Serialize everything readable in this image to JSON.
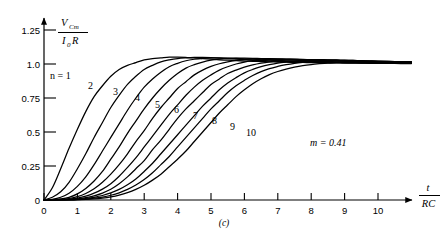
{
  "figure": {
    "label": "(c)",
    "annotation": "m = 0.41",
    "annotation_symbol": "m",
    "annotation_value": "0.41",
    "series_prefix": "n",
    "series_prefix_text": "n = 1"
  },
  "axes": {
    "y": {
      "label_numerator": "V",
      "label_numerator_sub": "Cm",
      "label_denominator": "I",
      "label_denominator_sub": "0",
      "label_denominator_tail": "R",
      "ticks": [
        "0",
        "0.25",
        "0.5",
        "0.75",
        "1.0",
        "1.25"
      ],
      "tick_values": [
        0,
        0.25,
        0.5,
        0.75,
        1.0,
        1.25
      ]
    },
    "x": {
      "label_numerator": "t",
      "label_denominator": "RC",
      "ticks": [
        "0",
        "1",
        "2",
        "3",
        "4",
        "5",
        "6",
        "7",
        "8",
        "9",
        "10"
      ],
      "tick_values": [
        0,
        1,
        2,
        3,
        4,
        5,
        6,
        7,
        8,
        9,
        10
      ]
    }
  },
  "curve_labels": [
    "1",
    "2",
    "3",
    "4",
    "5",
    "6",
    "7",
    "8",
    "9",
    "10"
  ],
  "chart_data": {
    "type": "line",
    "title": "",
    "xlabel": "t/RC",
    "ylabel": "V_Cm / (I_0 R)",
    "xlim": [
      0,
      11.2
    ],
    "ylim": [
      0,
      1.3
    ],
    "grid": false,
    "legend": "inline-curve-labels",
    "annotations": [
      "m = 0.41",
      "n = 1",
      "(c)"
    ],
    "xticks": [
      0,
      1,
      2,
      3,
      4,
      5,
      6,
      7,
      8,
      9,
      10
    ],
    "yticks": [
      0,
      0.25,
      0.5,
      0.75,
      1.0,
      1.25
    ],
    "x": [
      0,
      0.25,
      0.5,
      0.75,
      1,
      1.25,
      1.5,
      1.75,
      2,
      2.25,
      2.5,
      2.75,
      3,
      3.25,
      3.5,
      3.75,
      4,
      4.25,
      4.5,
      4.75,
      5,
      5.25,
      5.5,
      5.75,
      6,
      6.25,
      6.5,
      6.75,
      7,
      7.25,
      7.5,
      7.75,
      8,
      8.25,
      8.5,
      8.75,
      9,
      9.25,
      9.5,
      9.75,
      10,
      10.5,
      11
    ],
    "series": [
      {
        "name": "n = 1",
        "label": "1",
        "values": [
          0,
          0.09,
          0.23,
          0.38,
          0.52,
          0.65,
          0.76,
          0.84,
          0.91,
          0.96,
          0.99,
          1.01,
          1.03,
          1.04,
          1.045,
          1.05,
          1.05,
          1.048,
          1.045,
          1.04,
          1.035,
          1.03,
          1.028,
          1.025,
          1.022,
          1.02,
          1.018,
          1.016,
          1.014,
          1.013,
          1.012,
          1.011,
          1.01,
          1.009,
          1.008,
          1.008,
          1.007,
          1.006,
          1.006,
          1.005,
          1.005,
          1.004,
          1.003
        ]
      },
      {
        "name": "n = 2",
        "label": "2",
        "values": [
          0,
          0.02,
          0.06,
          0.13,
          0.23,
          0.34,
          0.46,
          0.57,
          0.68,
          0.77,
          0.85,
          0.91,
          0.96,
          0.99,
          1.015,
          1.03,
          1.04,
          1.045,
          1.048,
          1.048,
          1.046,
          1.043,
          1.04,
          1.036,
          1.032,
          1.029,
          1.026,
          1.023,
          1.02,
          1.018,
          1.016,
          1.014,
          1.013,
          1.012,
          1.011,
          1.01,
          1.009,
          1.008,
          1.007,
          1.007,
          1.006,
          1.005,
          1.004
        ]
      },
      {
        "name": "n = 3",
        "label": "3",
        "values": [
          0,
          0.005,
          0.02,
          0.05,
          0.1,
          0.17,
          0.26,
          0.36,
          0.46,
          0.56,
          0.66,
          0.75,
          0.83,
          0.89,
          0.94,
          0.98,
          1.005,
          1.024,
          1.035,
          1.042,
          1.045,
          1.045,
          1.044,
          1.041,
          1.038,
          1.035,
          1.031,
          1.028,
          1.025,
          1.022,
          1.02,
          1.018,
          1.016,
          1.014,
          1.013,
          1.012,
          1.011,
          1.01,
          1.009,
          1.008,
          1.007,
          1.006,
          1.005
        ]
      },
      {
        "name": "n = 4",
        "label": "4",
        "values": [
          0,
          0.002,
          0.008,
          0.02,
          0.045,
          0.085,
          0.14,
          0.21,
          0.3,
          0.39,
          0.49,
          0.58,
          0.67,
          0.75,
          0.82,
          0.88,
          0.93,
          0.97,
          0.995,
          1.014,
          1.028,
          1.036,
          1.041,
          1.043,
          1.043,
          1.042,
          1.04,
          1.037,
          1.034,
          1.031,
          1.028,
          1.025,
          1.022,
          1.02,
          1.018,
          1.016,
          1.014,
          1.013,
          1.012,
          1.011,
          1.01,
          1.008,
          1.007
        ]
      },
      {
        "name": "n = 5",
        "label": "5",
        "values": [
          0,
          0.001,
          0.004,
          0.011,
          0.025,
          0.048,
          0.082,
          0.13,
          0.19,
          0.26,
          0.34,
          0.43,
          0.51,
          0.6,
          0.68,
          0.75,
          0.82,
          0.87,
          0.92,
          0.955,
          0.982,
          1.002,
          1.016,
          1.026,
          1.033,
          1.037,
          1.039,
          1.039,
          1.038,
          1.036,
          1.034,
          1.032,
          1.029,
          1.027,
          1.024,
          1.022,
          1.02,
          1.018,
          1.016,
          1.014,
          1.013,
          1.011,
          1.009
        ]
      },
      {
        "name": "n = 6",
        "label": "6",
        "values": [
          0,
          0.0005,
          0.002,
          0.006,
          0.014,
          0.028,
          0.05,
          0.08,
          0.12,
          0.175,
          0.24,
          0.31,
          0.39,
          0.47,
          0.55,
          0.63,
          0.7,
          0.77,
          0.83,
          0.88,
          0.92,
          0.955,
          0.98,
          1.0,
          1.014,
          1.024,
          1.03,
          1.034,
          1.036,
          1.036,
          1.036,
          1.034,
          1.032,
          1.03,
          1.028,
          1.026,
          1.024,
          1.022,
          1.02,
          1.018,
          1.016,
          1.013,
          1.011
        ]
      },
      {
        "name": "n = 7",
        "label": "7",
        "values": [
          0,
          0.0003,
          0.001,
          0.003,
          0.008,
          0.017,
          0.031,
          0.051,
          0.079,
          0.12,
          0.17,
          0.23,
          0.29,
          0.37,
          0.44,
          0.52,
          0.6,
          0.67,
          0.73,
          0.79,
          0.85,
          0.89,
          0.93,
          0.955,
          0.977,
          0.993,
          1.006,
          1.016,
          1.023,
          1.028,
          1.031,
          1.032,
          1.033,
          1.032,
          1.031,
          1.03,
          1.028,
          1.026,
          1.024,
          1.022,
          1.02,
          1.017,
          1.014
        ]
      },
      {
        "name": "n = 8",
        "label": "8",
        "values": [
          0,
          0.0002,
          0.0007,
          0.002,
          0.005,
          0.011,
          0.02,
          0.033,
          0.052,
          0.078,
          0.112,
          0.155,
          0.21,
          0.27,
          0.34,
          0.41,
          0.48,
          0.55,
          0.62,
          0.69,
          0.75,
          0.81,
          0.86,
          0.9,
          0.935,
          0.96,
          0.98,
          0.995,
          1.007,
          1.015,
          1.021,
          1.025,
          1.027,
          1.028,
          1.029,
          1.028,
          1.027,
          1.026,
          1.024,
          1.023,
          1.021,
          1.018,
          1.015
        ]
      },
      {
        "name": "n = 9",
        "label": "9",
        "values": [
          0,
          0.0001,
          0.0004,
          0.001,
          0.003,
          0.007,
          0.013,
          0.022,
          0.035,
          0.053,
          0.078,
          0.11,
          0.15,
          0.2,
          0.26,
          0.32,
          0.39,
          0.46,
          0.53,
          0.6,
          0.67,
          0.73,
          0.79,
          0.84,
          0.88,
          0.915,
          0.944,
          0.966,
          0.982,
          0.995,
          1.005,
          1.012,
          1.017,
          1.02,
          1.022,
          1.023,
          1.023,
          1.023,
          1.022,
          1.021,
          1.02,
          1.018,
          1.016
        ]
      },
      {
        "name": "n = 10",
        "label": "10",
        "values": [
          0,
          5e-05,
          0.0002,
          0.0007,
          0.002,
          0.004,
          0.008,
          0.014,
          0.023,
          0.036,
          0.054,
          0.078,
          0.108,
          0.146,
          0.19,
          0.245,
          0.3,
          0.36,
          0.43,
          0.5,
          0.57,
          0.64,
          0.7,
          0.76,
          0.81,
          0.855,
          0.892,
          0.922,
          0.945,
          0.963,
          0.977,
          0.988,
          0.996,
          1.002,
          1.007,
          1.01,
          1.013,
          1.015,
          1.016,
          1.017,
          1.017,
          1.017,
          1.016
        ]
      }
    ]
  }
}
